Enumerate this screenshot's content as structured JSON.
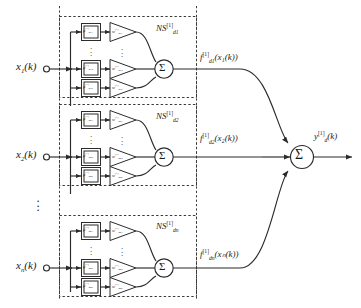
{
  "diagram": {
    "colors": {
      "line": "#2b2b2b",
      "dash": "#3a3a3a",
      "text": "#1a1a1a",
      "bg": "#ffffff"
    },
    "sum_glyph": "Σ",
    "mu_glyph": "μ",
    "w_glyph": "w",
    "dots_glyph": "⋮",
    "layer_superscript": "[1]",
    "rows": [
      {
        "id": "row-1",
        "input_label": {
          "base": "x",
          "sub": "1",
          "suffix": "(k)"
        },
        "block_label": {
          "base": "NS",
          "sup": "[1]",
          "sub": "d1"
        },
        "output_label": {
          "base": "f",
          "sup": "[1]",
          "sub": "d1",
          "suffix": "(x₁(k))"
        },
        "neurons": [
          {
            "mu": {
              "base": "μ",
              "sup": "[1]",
              "sub": "d11"
            },
            "w": {
              "base": "w",
              "sup": "[1]",
              "sub": "d11"
            }
          },
          {
            "mu": {
              "base": "μ",
              "sup": "[1]",
              "sub": "d12"
            },
            "w": {
              "base": "w",
              "sup": "[1]",
              "sub": "d12"
            }
          },
          {
            "mu": {
              "base": "μ",
              "sup": "[1]",
              "sub": "d1k"
            },
            "w": {
              "base": "w",
              "sup": "[1]",
              "sub": "d1k"
            }
          }
        ]
      },
      {
        "id": "row-2",
        "input_label": {
          "base": "x",
          "sub": "2",
          "suffix": "(k)"
        },
        "block_label": {
          "base": "NS",
          "sup": "[1]",
          "sub": "d2"
        },
        "output_label": {
          "base": "f",
          "sup": "[1]",
          "sub": "d2",
          "suffix": "(x₂(k))"
        },
        "neurons": [
          {
            "mu": {
              "base": "μ",
              "sup": "[1]",
              "sub": "d21"
            },
            "w": {
              "base": "w",
              "sup": "[1]",
              "sub": "d21"
            }
          },
          {
            "mu": {
              "base": "μ",
              "sup": "[1]",
              "sub": "d22"
            },
            "w": {
              "base": "w",
              "sup": "[1]",
              "sub": "d22"
            }
          },
          {
            "mu": {
              "base": "μ",
              "sup": "[1]",
              "sub": "d2k"
            },
            "w": {
              "base": "w",
              "sup": "[1]",
              "sub": "d2k"
            }
          }
        ]
      },
      {
        "id": "row-n",
        "input_label": {
          "base": "x",
          "sub": "n",
          "suffix": "(k)"
        },
        "block_label": {
          "base": "NS",
          "sup": "[1]",
          "sub": "dn"
        },
        "output_label": {
          "base": "f",
          "sup": "[1]",
          "sub": "dn",
          "suffix": "(xₙ(k))"
        },
        "neurons": [
          {
            "mu": {
              "base": "μ",
              "sup": "[1]",
              "sub": "dn1"
            },
            "w": {
              "base": "w",
              "sup": "[1]",
              "sub": "dn1"
            }
          },
          {
            "mu": {
              "base": "μ",
              "sup": "[1]",
              "sub": "dn2"
            },
            "w": {
              "base": "w",
              "sup": "[1]",
              "sub": "dn2"
            }
          },
          {
            "mu": {
              "base": "μ",
              "sup": "[1]",
              "sub": "dnk"
            },
            "w": {
              "base": "w",
              "sup": "[1]",
              "sub": "dnk"
            }
          }
        ]
      }
    ],
    "final_sum": {
      "glyph": "Σ"
    },
    "final_output": {
      "base": "y",
      "sup": "[1]",
      "sub": "d",
      "suffix": "(k)"
    }
  }
}
